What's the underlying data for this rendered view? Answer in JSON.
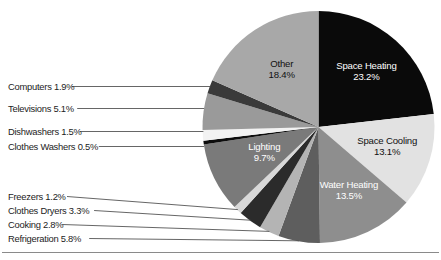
{
  "chart_data": {
    "type": "pie",
    "title": "",
    "subtitle": "",
    "xlabel": "",
    "ylabel": "",
    "legend_position": "none",
    "grid": false,
    "units": "percent",
    "total": 100.0,
    "start_angle_deg": 0,
    "direction": "clockwise",
    "categories": [
      "Space Heating",
      "Space Cooling",
      "Water Heating",
      "Refrigeration",
      "Cooking",
      "Clothes Dryers",
      "Freezers",
      "Lighting",
      "Clothes Washers",
      "Dishwashers",
      "Televisions",
      "Computers",
      "Other"
    ],
    "values": [
      23.2,
      13.1,
      13.5,
      5.8,
      2.8,
      3.3,
      1.2,
      9.7,
      0.5,
      1.5,
      5.1,
      1.9,
      18.4
    ],
    "colors": [
      "#0a0a0a",
      "#e2e2e2",
      "#8e8e8e",
      "#5e5e5e",
      "#b4b4b4",
      "#2b2b2b",
      "#d8d8d8",
      "#7a7a7a",
      "#0d0d0d",
      "#f2f2f2",
      "#9a9a9a",
      "#3a3a3a",
      "#a8a8a8"
    ],
    "label_text_colors": [
      "light",
      "dark",
      "light",
      "dark",
      "dark",
      "light",
      "dark",
      "light",
      "light",
      "dark",
      "dark",
      "light",
      "dark"
    ],
    "inside_labels": [
      {
        "name": "Space Heating",
        "line1": "Space Heating",
        "line2": "23.2%"
      },
      {
        "name": "Space Cooling",
        "line1": "Space Cooling",
        "line2": "13.1%"
      },
      {
        "name": "Water Heating",
        "line1": "Water Heating",
        "line2": "13.5%"
      },
      {
        "name": "Lighting",
        "line1": "Lighting",
        "line2": "9.7%"
      },
      {
        "name": "Other",
        "line1": "Other",
        "line2": "18.4%"
      }
    ],
    "callouts": [
      {
        "name": "Computers",
        "text": "Computers 1.9%"
      },
      {
        "name": "Televisions",
        "text": "Televisions 5.1%"
      },
      {
        "name": "Dishwashers",
        "text": "Dishwashers 1.5%"
      },
      {
        "name": "Clothes Washers",
        "text": "Clothes Washers 0.5%"
      },
      {
        "name": "Freezers",
        "text": "Freezers 1.2%"
      },
      {
        "name": "Clothes Dryers",
        "text": "Clothes Dryers 3.3%"
      },
      {
        "name": "Cooking",
        "text": "Cooking 2.8%"
      },
      {
        "name": "Refrigeration",
        "text": "Refrigeration 5.8%"
      }
    ]
  },
  "geometry": {
    "center_x": 318.5,
    "center_y": 127,
    "radius": 116
  },
  "callout_layout": [
    {
      "key": "Computers",
      "text_x": 8,
      "text_y": 90,
      "line_y": 86.5,
      "slanted": false
    },
    {
      "key": "Televisions",
      "text_x": 8,
      "text_y": 112,
      "line_y": 108.5,
      "slanted": false
    },
    {
      "key": "Dishwashers",
      "text_x": 8,
      "text_y": 135,
      "line_y": 131.5,
      "slanted": false
    },
    {
      "key": "Clothes Washers",
      "text_x": 8,
      "text_y": 150,
      "line_y": 146.5,
      "slanted": false
    },
    {
      "key": "Freezers",
      "text_x": 8,
      "text_y": 200,
      "line_y": 196.5,
      "slanted": true
    },
    {
      "key": "Clothes Dryers",
      "text_x": 8,
      "text_y": 214,
      "line_y": 210.5,
      "slanted": true
    },
    {
      "key": "Cooking",
      "text_x": 8,
      "text_y": 228,
      "line_y": 224.5,
      "slanted": true
    },
    {
      "key": "Refrigeration",
      "text_x": 8,
      "text_y": 242,
      "line_y": 238.5,
      "slanted": true
    }
  ],
  "rules": [
    {
      "name": "bottom-rule",
      "x1": 2,
      "y1": 252.5,
      "x2": 439,
      "y2": 252.5
    }
  ]
}
